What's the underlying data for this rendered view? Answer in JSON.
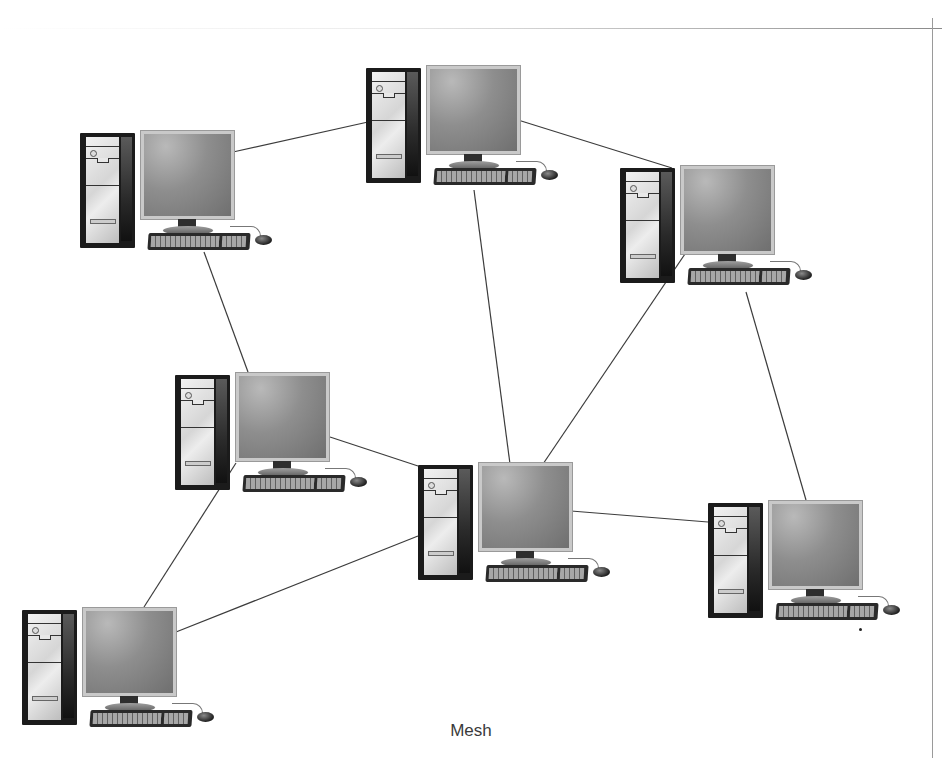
{
  "diagram": {
    "type": "network-topology",
    "caption": "Mesh",
    "colors": {
      "background": "#ffffff",
      "link": "#3c3c3c",
      "tower": "#1b1b1b",
      "screen": "#8e8e8e"
    },
    "nodes": [
      {
        "id": "pc-1",
        "label": "",
        "x": 80,
        "y": 130
      },
      {
        "id": "pc-2",
        "label": "",
        "x": 366,
        "y": 65
      },
      {
        "id": "pc-3",
        "label": "",
        "x": 620,
        "y": 165
      },
      {
        "id": "pc-4",
        "label": "",
        "x": 175,
        "y": 372
      },
      {
        "id": "pc-5",
        "label": "",
        "x": 418,
        "y": 462
      },
      {
        "id": "pc-6",
        "label": "",
        "x": 708,
        "y": 500
      },
      {
        "id": "pc-7",
        "label": "",
        "x": 22,
        "y": 607
      }
    ],
    "links": [
      {
        "from": "pc-1",
        "to": "pc-2",
        "x1": 233,
        "y1": 152,
        "x2": 368,
        "y2": 122
      },
      {
        "from": "pc-2",
        "to": "pc-3",
        "x1": 518,
        "y1": 120,
        "x2": 672,
        "y2": 168
      },
      {
        "from": "pc-1",
        "to": "pc-4",
        "x1": 204,
        "y1": 252,
        "x2": 248,
        "y2": 372
      },
      {
        "from": "pc-2",
        "to": "pc-5",
        "x1": 474,
        "y1": 190,
        "x2": 510,
        "y2": 464
      },
      {
        "from": "pc-3",
        "to": "pc-5",
        "x1": 685,
        "y1": 254,
        "x2": 543,
        "y2": 464
      },
      {
        "from": "pc-3",
        "to": "pc-6",
        "x1": 746,
        "y1": 292,
        "x2": 806,
        "y2": 500
      },
      {
        "from": "pc-4",
        "to": "pc-5",
        "x1": 330,
        "y1": 437,
        "x2": 418,
        "y2": 466
      },
      {
        "from": "pc-5",
        "to": "pc-6",
        "x1": 571,
        "y1": 511,
        "x2": 708,
        "y2": 522
      },
      {
        "from": "pc-4",
        "to": "pc-7",
        "x1": 236,
        "y1": 463,
        "x2": 144,
        "y2": 607
      },
      {
        "from": "pc-5",
        "to": "pc-7",
        "x1": 418,
        "y1": 536,
        "x2": 176,
        "y2": 632
      }
    ]
  }
}
